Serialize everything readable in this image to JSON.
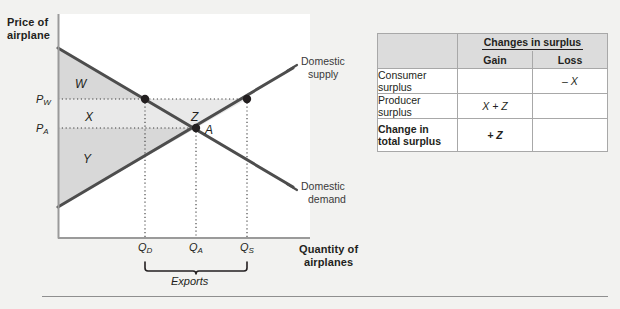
{
  "figure": {
    "axes": {
      "y_title": "Price of airplane",
      "y_title_line1": "Price of",
      "y_title_line2": "airplane",
      "x_title": "Quantity of airplanes",
      "x_title_line1": "Quantity of",
      "x_title_line2": "airplanes"
    },
    "curves": [
      {
        "name": "domestic-supply",
        "label_line1": "Domestic",
        "label_line2": "supply"
      },
      {
        "name": "domestic-demand",
        "label_line1": "Domestic",
        "label_line2": "demand"
      }
    ],
    "price_ticks": [
      {
        "symbol": "P",
        "sub": "W",
        "name": "world-price"
      },
      {
        "symbol": "P",
        "sub": "A",
        "name": "autarky-price"
      }
    ],
    "quantity_ticks": [
      {
        "symbol": "Q",
        "sub": "D",
        "name": "quantity-demanded"
      },
      {
        "symbol": "Q",
        "sub": "A",
        "name": "quantity-autarky"
      },
      {
        "symbol": "Q",
        "sub": "S",
        "name": "quantity-supplied"
      }
    ],
    "regions": [
      {
        "id": "W",
        "label": "W"
      },
      {
        "id": "X",
        "label": "X"
      },
      {
        "id": "Y",
        "label": "Y"
      },
      {
        "id": "Z",
        "label": "Z"
      }
    ],
    "points": [
      {
        "id": "A",
        "label": "A"
      }
    ],
    "bracket_label": "Exports",
    "colors": {
      "panel_bg": "#f2f2f0",
      "plot_bg": "#ffffff",
      "curve": "#4d4d4d",
      "shade_light": "#e9e9e9",
      "shade_mid": "#d8d8d8",
      "axis": "#9a9a9a",
      "text": "#231f20",
      "table_header_bg": "#dcdcdc",
      "table_border": "#a8a8a8"
    }
  },
  "table": {
    "corner_label": "",
    "group_header": "Changes in surplus",
    "columns": [
      "Gain",
      "Loss"
    ],
    "rows": [
      {
        "label": "Consumer surplus",
        "gain": "",
        "loss": "– X",
        "bold": false
      },
      {
        "label": "Producer surplus",
        "gain": "X + Z",
        "loss": "",
        "bold": false
      },
      {
        "label": "Change in total surplus",
        "label_line1": "Change in",
        "label_line2": "total surplus",
        "gain": "+ Z",
        "loss": "",
        "bold": true
      }
    ]
  }
}
